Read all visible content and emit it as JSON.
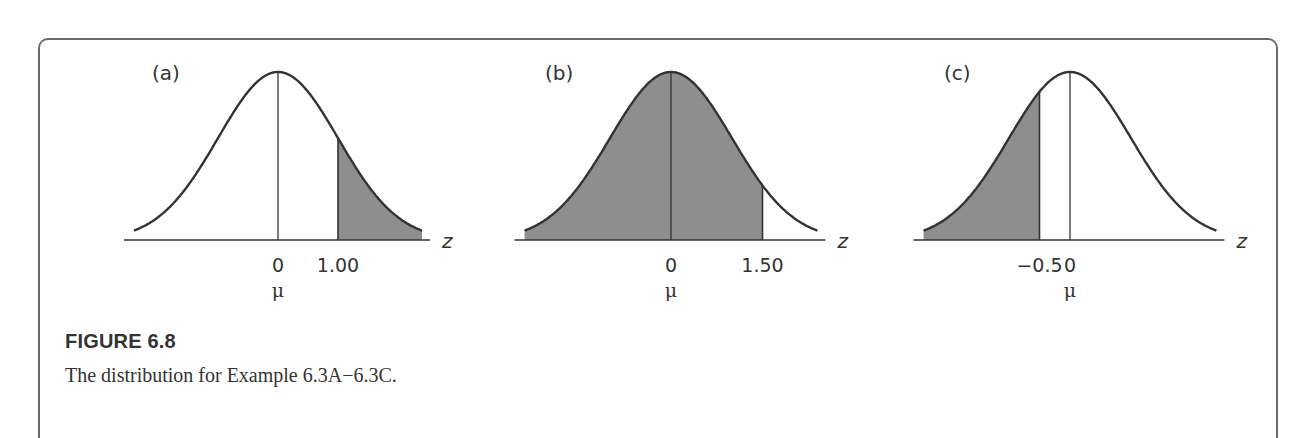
{
  "figure": {
    "title": "FIGURE 6.8",
    "caption": "The distribution for Example 6.3A−6.3C."
  },
  "style": {
    "shade_color": "#8e8e8e",
    "line_color": "#333333",
    "frame_color": "#6a6a6a"
  },
  "chart_data": [
    {
      "type": "area",
      "panel": "(a)",
      "distribution": "standard normal",
      "xlabel": "z",
      "tick_labels": [
        "0",
        "1.00"
      ],
      "tick_values": [
        0,
        1.0
      ],
      "mean_label": "μ",
      "shaded_region": {
        "from": 1.0,
        "to": "+inf",
        "description": "right tail beyond z = 1.00"
      },
      "x_range": [
        -2.4,
        2.4
      ]
    },
    {
      "type": "area",
      "panel": "(b)",
      "distribution": "standard normal",
      "xlabel": "z",
      "tick_labels": [
        "0",
        "1.50"
      ],
      "tick_values": [
        0,
        1.5
      ],
      "mean_label": "μ",
      "shaded_region": {
        "from": "-inf",
        "to": 1.5,
        "description": "area left of z = 1.50"
      },
      "x_range": [
        -2.4,
        2.4
      ]
    },
    {
      "type": "area",
      "panel": "(c)",
      "distribution": "standard normal",
      "xlabel": "z",
      "tick_labels": [
        "−0.5",
        "0"
      ],
      "tick_values": [
        -0.5,
        0
      ],
      "mean_label": "μ",
      "shaded_region": {
        "from": "-inf",
        "to": -0.5,
        "description": "left tail below z = −0.5"
      },
      "x_range": [
        -2.4,
        2.4
      ]
    }
  ]
}
